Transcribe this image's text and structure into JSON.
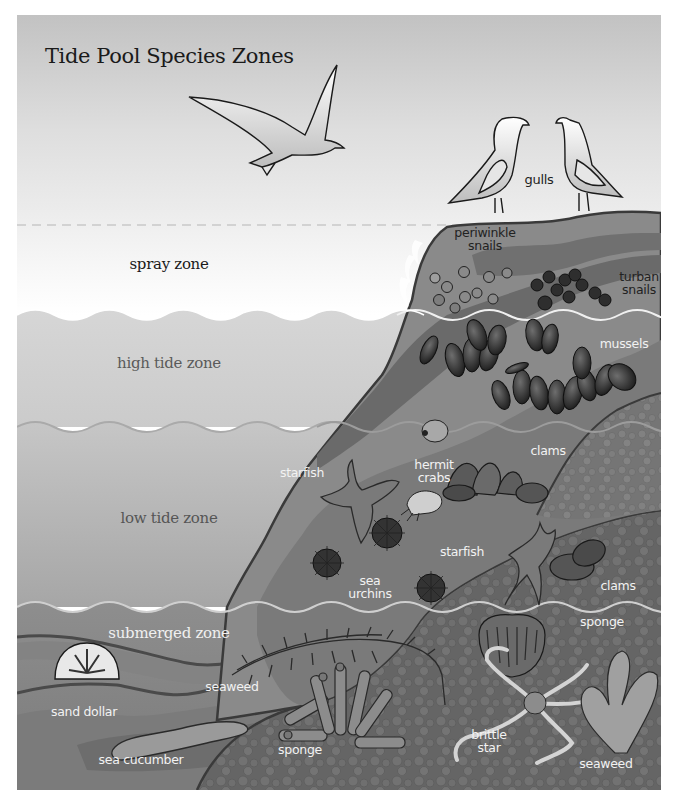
{
  "title": "Tide Pool Species Zones",
  "zones": [
    {
      "label": "spray zone",
      "color": "#1a1a1a"
    },
    {
      "label": "high tide zone",
      "color": "#5a5a5a"
    },
    {
      "label": "low tide zone",
      "color": "#555555"
    },
    {
      "label": "submerged zone",
      "color": "#f0f0f0"
    }
  ],
  "species": {
    "gulls": "gulls",
    "periwinkle": [
      "periwinkle",
      "snails"
    ],
    "turban": [
      "turban",
      "snails"
    ],
    "mussels": "mussels",
    "starfish_left": "starfish",
    "hermit": [
      "hermit",
      "crabs"
    ],
    "clams_top": "clams",
    "starfish_right": "starfish",
    "sea_urchins": [
      "sea",
      "urchins"
    ],
    "clams_bottom": "clams",
    "sponge_right": "sponge",
    "seaweed_left": "seaweed",
    "sand_dollar": "sand dollar",
    "sea_cucumber": "sea cucumber",
    "sponge_bottom": "sponge",
    "brittle_star": [
      "brittle",
      "star"
    ],
    "seaweed_right": "seaweed"
  },
  "colors": {
    "sky_top": "#c4c4c4",
    "spray_band": "#f4f4f4",
    "high_tide": "#d2d2d2",
    "low_tide": "#c2c2c2",
    "submerged": "#8c8c8c",
    "rock_light": "#8e8e8e",
    "rock_mid": "#767676",
    "rock_dark": "#5e5e5e",
    "seafloor": "#6a6a6a"
  }
}
